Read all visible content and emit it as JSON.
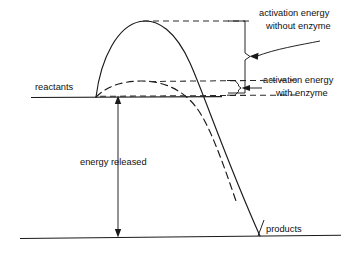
{
  "diagram": {
    "labels": {
      "reactants": "reactants",
      "products": "products",
      "energy_released": "energy released",
      "activation_without_line1": "activation energy",
      "activation_without_line2": "without enzyme",
      "activation_with_line1": "activation energy",
      "activation_with_line2": "with enzyme"
    },
    "colors": {
      "line": "#1a1a1a",
      "dashed": "#2b2b2b",
      "background": "#ffffff"
    },
    "levels": {
      "reactants_y": 97,
      "products_y": 236,
      "peak_without_enzyme_y": 21,
      "peak_with_enzyme_y": 82
    },
    "curves": {
      "without_enzyme": "solid",
      "with_enzyme": "dashed"
    }
  }
}
